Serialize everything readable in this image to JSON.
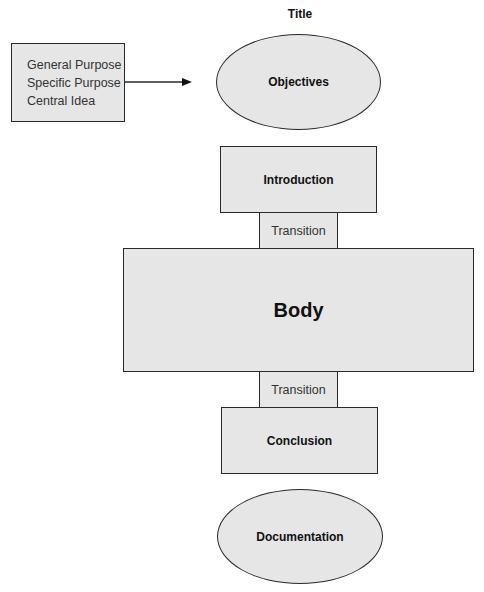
{
  "diagram": {
    "title": "Title",
    "purpose_box": {
      "lines": [
        "General Purpose",
        "Specific Purpose",
        "Central Idea"
      ]
    },
    "objectives": "Objectives",
    "introduction": "Introduction",
    "transition_1": "Transition",
    "body": "Body",
    "transition_2": "Transition",
    "conclusion": "Conclusion",
    "documentation": "Documentation",
    "colors": {
      "fill": "#e6e6e6",
      "stroke": "#2a2a2a",
      "background": "#ffffff"
    }
  }
}
